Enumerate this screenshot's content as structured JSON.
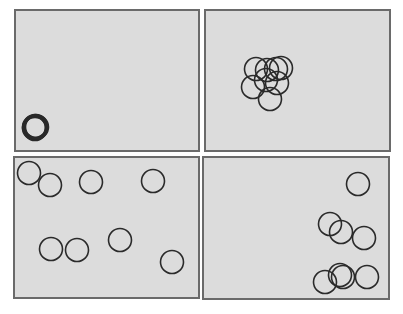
{
  "figure": {
    "background": "#ffffff",
    "panel_fill": "#dcdcdc",
    "panel_border": "#6a6a6a",
    "circle_stroke": "#2a2a2a",
    "circle_radius": 11.5,
    "panels": [
      {
        "id": "top-left",
        "box": [
          14,
          9,
          186,
          143
        ],
        "description": "tightly stacked circles at lower-left corner",
        "circles": [
          [
            35,
            127
          ],
          [
            36,
            126
          ],
          [
            34,
            128
          ],
          [
            35,
            126
          ],
          [
            36,
            128
          ],
          [
            34,
            127
          ],
          [
            35,
            129
          ],
          [
            37,
            127
          ]
        ]
      },
      {
        "id": "top-right",
        "box": [
          204,
          9,
          187,
          143
        ],
        "description": "overlapping cluster near center-left",
        "circles": [
          [
            256,
            69
          ],
          [
            267,
            70
          ],
          [
            276,
            69
          ],
          [
            281,
            68
          ],
          [
            253,
            87
          ],
          [
            266,
            80
          ],
          [
            277,
            83
          ],
          [
            270,
            99
          ]
        ]
      },
      {
        "id": "bottom-left",
        "box": [
          13,
          156,
          187,
          143
        ],
        "description": "circles spread across panel",
        "circles": [
          [
            29,
            173
          ],
          [
            50,
            185
          ],
          [
            91,
            182
          ],
          [
            153,
            181
          ],
          [
            51,
            249
          ],
          [
            77,
            250
          ],
          [
            120,
            240
          ],
          [
            172,
            262
          ]
        ]
      },
      {
        "id": "bottom-right",
        "box": [
          202,
          156,
          188,
          144
        ],
        "description": "circles clustered along right side",
        "circles": [
          [
            358,
            184
          ],
          [
            330,
            224
          ],
          [
            341,
            232
          ],
          [
            364,
            238
          ],
          [
            325,
            282
          ],
          [
            340,
            275
          ],
          [
            343,
            277
          ],
          [
            367,
            277
          ]
        ]
      }
    ]
  }
}
